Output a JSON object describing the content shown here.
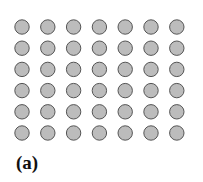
{
  "figure": {
    "label": "(a)",
    "grid": {
      "rows": 6,
      "cols": 7,
      "origin_x": 22,
      "origin_y": 27,
      "dx": 25.8,
      "dy": 21.2,
      "radius": 7.2,
      "fill": "#bcbcbc",
      "stroke": "#555555"
    }
  }
}
